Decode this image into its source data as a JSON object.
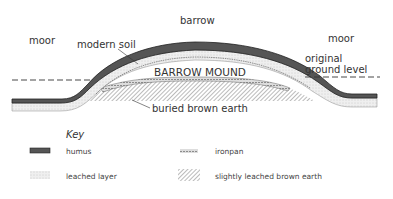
{
  "labels": {
    "barrow": "barrow",
    "moor_left": "moor",
    "moor_right": "moor",
    "modern_soil": "modern soil",
    "original_ground_level": [
      "original",
      "ground level"
    ],
    "barrow_mound": "BARROW MOUND",
    "buried_brown_earth": "buried brown earth"
  },
  "key": {
    "title": "Key",
    "items": [
      {
        "symbol": "humus-swatch",
        "label": "humus"
      },
      {
        "symbol": "leached-layer-swatch",
        "label": "leached layer"
      },
      {
        "symbol": "ironpan-swatch",
        "label": "ironpan"
      },
      {
        "symbol": "hatched-swatch",
        "label": "slightly leached brown earth"
      }
    ]
  },
  "colors": {
    "ink": "#2a2a2a",
    "humus": "#3a3a3a",
    "leached": "#e6e6e6",
    "hatch": "#555555"
  }
}
